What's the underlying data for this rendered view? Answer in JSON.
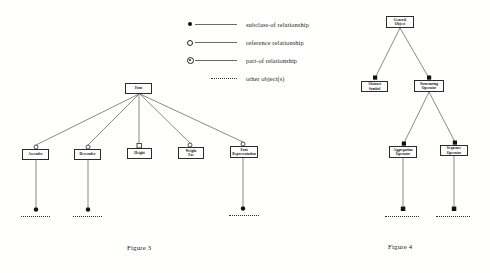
{
  "legend": {
    "items": [
      {
        "icon": "filled-circle",
        "label": "subclass-of relationship"
      },
      {
        "icon": "open-circle",
        "label": "reference relationship"
      },
      {
        "icon": "part-of-circle",
        "label": "part-of relationship"
      },
      {
        "icon": "dotted-line",
        "label": "other object(s)"
      }
    ]
  },
  "figure3": {
    "caption": "Figure 3",
    "nodes": {
      "root": {
        "line1": "Font"
      },
      "child1": {
        "line1": "Ascender"
      },
      "child2": {
        "line1": "Descender"
      },
      "child3": {
        "line1": "Height"
      },
      "child4": {
        "line1": "Weight",
        "line2": "Fac"
      },
      "child5": {
        "line1": "Font",
        "line2": "Representation"
      }
    }
  },
  "figure4": {
    "caption": "Figure 4",
    "nodes": {
      "root": {
        "line1": "General",
        "line2": "Object"
      },
      "left": {
        "line1": "Abstract",
        "line2": "Symbol"
      },
      "right": {
        "line1": "Structuring",
        "line2": "Operator"
      },
      "gchild1": {
        "line1": "Aggregation",
        "line2": "Operator"
      },
      "gchild2": {
        "line1": "Sequence",
        "line2": "Operator"
      }
    }
  },
  "colors": {
    "edge": "#565656",
    "marker": "#111111",
    "box_border": "#2b2b2b"
  }
}
